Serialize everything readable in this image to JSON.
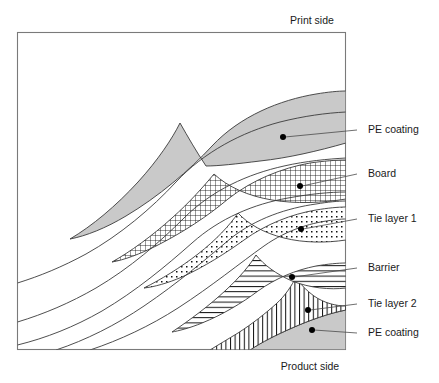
{
  "figure": {
    "type": "layer-cross-section-diagram",
    "title_top": "Print side",
    "title_bottom": "Product side",
    "frame": {
      "x": 17,
      "y": 32,
      "width": 329,
      "height": 318
    },
    "colors": {
      "pe_coating_fill": "#c9c9c9",
      "stroke": "#3a3a3a",
      "frame_stroke": "#7a7a7a",
      "leader_stroke": "#4a4a4a",
      "text": "#1a1a1a",
      "background": "#ffffff"
    },
    "callouts": [
      {
        "id": "pe-coating-top",
        "label": "PE coating",
        "pattern": "solid-gray",
        "text_x": 368,
        "text_y": 133,
        "leader_x1": 357,
        "leader_y1": 130,
        "dot_x": 283,
        "dot_y": 137
      },
      {
        "id": "board",
        "label": "Board",
        "pattern": "cross-hatch",
        "text_x": 368,
        "text_y": 177,
        "leader_x1": 357,
        "leader_y1": 174,
        "dot_x": 300,
        "dot_y": 186
      },
      {
        "id": "tie-layer-1",
        "label": "Tie layer 1",
        "pattern": "dotted",
        "text_x": 368,
        "text_y": 222,
        "leader_x1": 357,
        "leader_y1": 219,
        "dot_x": 301,
        "dot_y": 229
      },
      {
        "id": "barrier",
        "label": "Barrier",
        "pattern": "horizontal-hatch",
        "text_x": 368,
        "text_y": 270,
        "leader_x1": 357,
        "leader_y1": 268,
        "dot_x": 292,
        "dot_y": 277
      },
      {
        "id": "tie-layer-2",
        "label": "Tie layer 2",
        "pattern": "vertical-hatch",
        "text_x": 368,
        "text_y": 306,
        "leader_x1": 357,
        "leader_y1": 304,
        "dot_x": 308,
        "dot_y": 310
      },
      {
        "id": "pe-coating-bottom",
        "label": "PE coating",
        "pattern": "solid-gray",
        "text_x": 368,
        "text_y": 335,
        "leader_x1": 357,
        "leader_y1": 333,
        "dot_x": 312,
        "dot_y": 330
      }
    ],
    "layer_order_print_to_product": [
      "PE coating",
      "Board",
      "Tie layer 1",
      "Barrier",
      "Tie layer 2",
      "PE coating"
    ]
  }
}
